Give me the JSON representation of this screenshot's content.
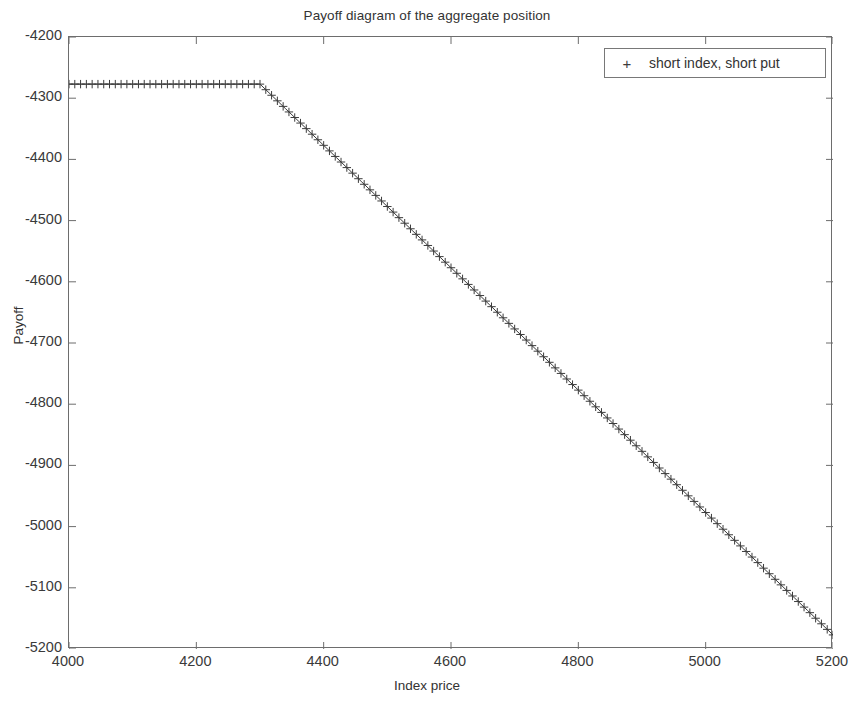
{
  "chart_data": {
    "type": "line",
    "title": "Payoff diagram of the aggregate position",
    "xlabel": "Index price",
    "ylabel": "Payoff",
    "xlim": [
      4000,
      5200
    ],
    "ylim": [
      -5200,
      -4200
    ],
    "xticks": [
      4000,
      4200,
      4400,
      4600,
      4800,
      5000,
      5200
    ],
    "yticks": [
      -4200,
      -4300,
      -4400,
      -4500,
      -4600,
      -4700,
      -4800,
      -4900,
      -5000,
      -5100,
      -5200
    ],
    "xtick_labels": [
      "4000",
      "4200",
      "4400",
      "4600",
      "4800",
      "5000",
      "5200"
    ],
    "ytick_labels": [
      "-4200",
      "-4300",
      "-4400",
      "-4500",
      "-4600",
      "-4700",
      "-4800",
      "-4900",
      "-5000",
      "-5100",
      "-5200"
    ],
    "grid": false,
    "legend_position": "top-right",
    "marker": "+",
    "line_color": "#3c3c3c",
    "series": [
      {
        "name": "short index, short put",
        "marker": "+",
        "breakpoint_x": 4300,
        "plateau_y": -4277,
        "x": [
          4000,
          4020,
          4040,
          4060,
          4080,
          4100,
          4120,
          4140,
          4160,
          4180,
          4200,
          4220,
          4240,
          4260,
          4280,
          4300,
          4320,
          4340,
          4360,
          4380,
          4400,
          4420,
          4440,
          4460,
          4480,
          4500,
          4520,
          4540,
          4560,
          4580,
          4600,
          4620,
          4640,
          4660,
          4680,
          4700,
          4720,
          4740,
          4760,
          4780,
          4800,
          4820,
          4840,
          4860,
          4880,
          4900,
          4920,
          4940,
          4960,
          4980,
          5000,
          5020,
          5040,
          5060,
          5080,
          5100,
          5120,
          5140,
          5160,
          5180,
          5200
        ],
        "y": [
          -4277,
          -4277,
          -4277,
          -4277,
          -4277,
          -4277,
          -4277,
          -4277,
          -4277,
          -4277,
          -4277,
          -4277,
          -4277,
          -4277,
          -4277,
          -4277,
          -4297,
          -4317,
          -4337,
          -4357,
          -4377,
          -4397,
          -4417,
          -4437,
          -4457,
          -4477,
          -4497,
          -4517,
          -4537,
          -4557,
          -4577,
          -4597,
          -4617,
          -4637,
          -4657,
          -4677,
          -4697,
          -4717,
          -4737,
          -4757,
          -4777,
          -4797,
          -4817,
          -4837,
          -4857,
          -4877,
          -4897,
          -4917,
          -4937,
          -4957,
          -4977,
          -4997,
          -5017,
          -5037,
          -5057,
          -5077,
          -5097,
          -5117,
          -5137,
          -5157,
          -5177
        ]
      }
    ]
  },
  "legend": {
    "marker_glyph": "+",
    "entry_label": "short index, short put"
  },
  "axes": {
    "title": "Payoff diagram of the aggregate position",
    "xlabel": "Index price",
    "ylabel": "Payoff"
  }
}
